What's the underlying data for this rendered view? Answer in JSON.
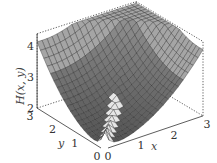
{
  "chart_data": {
    "type": "surface3d",
    "title": "",
    "xlabel": "x",
    "ylabel": "y",
    "zlabel": "H(x, y)",
    "xlim": [
      0,
      3
    ],
    "ylim": [
      0,
      3
    ],
    "zlim": [
      2,
      4.4
    ],
    "xticks": [
      "0",
      "1",
      "2",
      "3"
    ],
    "yticks": [
      "0",
      "1",
      "2",
      "3"
    ],
    "zticks": [
      "2",
      "3",
      "4"
    ],
    "surface_samples": {
      "corner_00": 2.0,
      "corner_30": 4.2,
      "corner_03": 4.2,
      "corner_33": 4.3
    },
    "grid": false,
    "box": "dotted back edges"
  }
}
